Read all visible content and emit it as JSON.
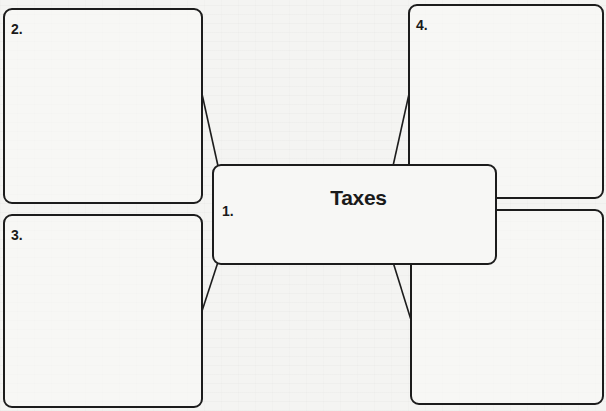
{
  "diagram": {
    "type": "graphic-organizer",
    "center": {
      "number": "1.",
      "title": "Taxes"
    },
    "boxes": [
      {
        "id": 2,
        "label": "2.",
        "position": "top-left",
        "content": ""
      },
      {
        "id": 3,
        "label": "3.",
        "position": "bottom-left",
        "content": ""
      },
      {
        "id": 4,
        "label": "4.",
        "position": "top-right",
        "content": ""
      },
      {
        "id": 5,
        "label": "5.",
        "position": "bottom-right",
        "content": ""
      }
    ],
    "connectors": [
      {
        "from": 1,
        "to": 2
      },
      {
        "from": 1,
        "to": 3
      },
      {
        "from": 1,
        "to": 4
      },
      {
        "from": 1,
        "to": 5
      }
    ],
    "colors": {
      "stroke": "#1c1c1c",
      "background": "#f4f4f2"
    }
  }
}
